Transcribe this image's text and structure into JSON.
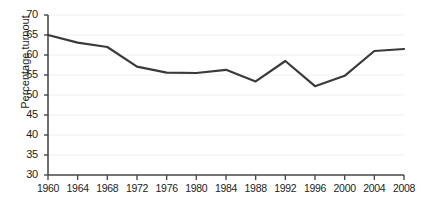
{
  "chart_data": {
    "type": "line",
    "title": "",
    "subtitle": "",
    "xlabel": "",
    "ylabel": "Percentage turnout",
    "x": [
      1960,
      1964,
      1968,
      1972,
      1976,
      1980,
      1984,
      1988,
      1992,
      1996,
      2000,
      2004,
      2008
    ],
    "categories": [
      "1960",
      "1964",
      "1968",
      "1972",
      "1976",
      "1980",
      "1984",
      "1988",
      "1992",
      "1996",
      "2000",
      "2004",
      "2008"
    ],
    "values": [
      65.0,
      63.1,
      62.0,
      57.1,
      55.6,
      55.5,
      56.3,
      53.4,
      58.5,
      52.2,
      54.8,
      61.0,
      61.5
    ],
    "series": [
      {
        "name": "Percentage turnout",
        "values": [
          65.0,
          63.1,
          62.0,
          57.1,
          55.6,
          55.5,
          56.3,
          53.4,
          58.5,
          52.2,
          54.8,
          61.0,
          61.5
        ]
      }
    ],
    "xlim": [
      1960,
      2008
    ],
    "ylim": [
      30,
      70
    ],
    "ytick_labels": [
      "30",
      "35",
      "40",
      "45",
      "50",
      "55",
      "60",
      "65",
      "70"
    ],
    "yticks": [
      30,
      35,
      40,
      45,
      50,
      55,
      60,
      65,
      70
    ],
    "xtick_labels": [
      "1960",
      "1964",
      "1968",
      "1972",
      "1976",
      "1980",
      "1984",
      "1988",
      "1992",
      "1996",
      "2000",
      "2004",
      "2008"
    ],
    "grid": true,
    "grid_axis": "y",
    "legend": false,
    "legend_position": "none",
    "annotations": [],
    "line_color": "#3a3a3a",
    "grid_color": "#f0f0f0",
    "axis_color": "#4a4a4a",
    "background_color": "#ffffff",
    "text_color": "#1d1d1d"
  }
}
